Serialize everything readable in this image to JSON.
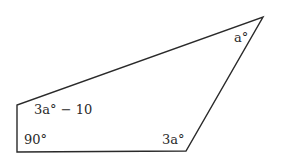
{
  "diagram": {
    "type": "quadrilateral",
    "vertices": [
      {
        "name": "bottom-left",
        "x": 17,
        "y": 152
      },
      {
        "name": "top-left",
        "x": 17,
        "y": 105
      },
      {
        "name": "top-right",
        "x": 263,
        "y": 17
      },
      {
        "name": "bottom-right",
        "x": 186,
        "y": 151
      }
    ],
    "angle_labels": {
      "bottom_left": "90°",
      "top_left": "3a° − 10",
      "top_right": "a°",
      "bottom_right": "3a°"
    },
    "stroke_color": "#2a2a2a"
  }
}
